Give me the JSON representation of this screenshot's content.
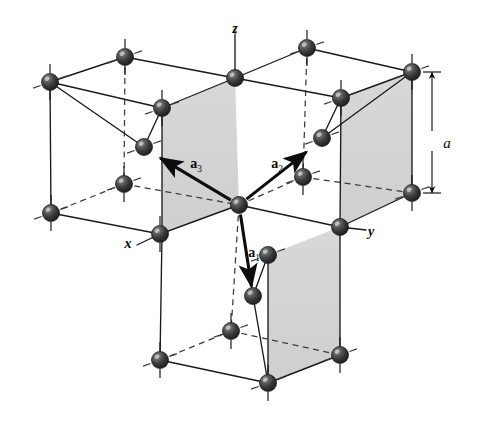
{
  "figure": {
    "background_color": "#ffffff",
    "width": 481,
    "height": 424
  },
  "colors": {
    "atom_dark": "#2b2b2b",
    "atom_mid": "#4a4a4a",
    "atom_highlight": "#c8c8c8",
    "line_solid": "#1a1a1a",
    "line_dashed": "#3a3a3a",
    "face_shade": "#d3d3d3",
    "label": "#0a0a0a"
  },
  "axes": [
    {
      "id": "x",
      "label": "x",
      "x": 128,
      "y": 245
    },
    {
      "id": "y",
      "label": "y",
      "x": 371,
      "y": 233
    },
    {
      "id": "z",
      "label": "z",
      "x": 235,
      "y": 30
    }
  ],
  "dimension": {
    "label": "a",
    "label_x": 447,
    "label_y": 145,
    "arrow_x": 432,
    "arrow_top_y": 72,
    "arrow_bottom_y": 193
  },
  "vectors": [
    {
      "id": "a1",
      "name": "a",
      "subscript": "1",
      "label_x": 254,
      "label_y": 257,
      "from_x": 239,
      "from_y": 205,
      "to_x": 253,
      "to_y": 296
    },
    {
      "id": "a2",
      "name": "a",
      "subscript": "2",
      "label_x": 277,
      "label_y": 168,
      "from_x": 239,
      "from_y": 205,
      "to_x": 314,
      "to_y": 146
    },
    {
      "id": "a3",
      "name": "a",
      "subscript": "3",
      "label_x": 196,
      "label_y": 168,
      "from_x": 239,
      "from_y": 205,
      "to_x": 152,
      "to_y": 153
    }
  ],
  "atoms": [
    {
      "id": "atom-01",
      "x": 50,
      "y": 82,
      "r": 8.5
    },
    {
      "id": "atom-02",
      "x": 125,
      "y": 57,
      "r": 8.5
    },
    {
      "id": "atom-03",
      "x": 235,
      "y": 78,
      "r": 8.5
    },
    {
      "id": "atom-04",
      "x": 307,
      "y": 48,
      "r": 8.5
    },
    {
      "id": "atom-05",
      "x": 412,
      "y": 72,
      "r": 8.5
    },
    {
      "id": "atom-06",
      "x": 162,
      "y": 108,
      "r": 8.5
    },
    {
      "id": "atom-07",
      "x": 341,
      "y": 98,
      "r": 8.5
    },
    {
      "id": "atom-08",
      "x": 144,
      "y": 147,
      "r": 8.5
    },
    {
      "id": "atom-09",
      "x": 322,
      "y": 138,
      "r": 8.5
    },
    {
      "id": "atom-10",
      "x": 124,
      "y": 184,
      "r": 8.5
    },
    {
      "id": "atom-11",
      "x": 303,
      "y": 177,
      "r": 8.5
    },
    {
      "id": "atom-12",
      "x": 51,
      "y": 213,
      "r": 8.5
    },
    {
      "id": "atom-13",
      "x": 239,
      "y": 205,
      "r": 8.5
    },
    {
      "id": "atom-14",
      "x": 412,
      "y": 193,
      "r": 8.5
    },
    {
      "id": "atom-15",
      "x": 160,
      "y": 234,
      "r": 8.5
    },
    {
      "id": "atom-16",
      "x": 340,
      "y": 227,
      "r": 8.5
    },
    {
      "id": "atom-17",
      "x": 268,
      "y": 255,
      "r": 8.5
    },
    {
      "id": "atom-18",
      "x": 253,
      "y": 296,
      "r": 8.5
    },
    {
      "id": "atom-19",
      "x": 231,
      "y": 331,
      "r": 8.5
    },
    {
      "id": "atom-20",
      "x": 160,
      "y": 360,
      "r": 8.5
    },
    {
      "id": "atom-21",
      "x": 340,
      "y": 355,
      "r": 8.5
    },
    {
      "id": "atom-22",
      "x": 268,
      "y": 383,
      "r": 8.5
    }
  ],
  "shaded_faces": [
    {
      "id": "face-upper-left",
      "points": "162,108 235,78 239,205 162,232"
    },
    {
      "id": "face-upper-right",
      "points": "340,227 412,193 412,72 340,98"
    },
    {
      "id": "face-lower-right",
      "points": "268,383 340,355 340,227 268,255"
    }
  ],
  "solid_edges": [
    {
      "id": "e-top-back-left",
      "x1": 50,
      "y1": 82,
      "x2": 125,
      "y2": 57
    },
    {
      "id": "e-top-left-mid",
      "x1": 125,
      "y1": 57,
      "x2": 235,
      "y2": 78
    },
    {
      "id": "e-top-mid-right",
      "x1": 235,
      "y1": 78,
      "x2": 307,
      "y2": 48
    },
    {
      "id": "e-top-right-end",
      "x1": 307,
      "y1": 48,
      "x2": 412,
      "y2": 72
    },
    {
      "id": "e-top-leftface",
      "x1": 50,
      "y1": 82,
      "x2": 162,
      "y2": 108
    },
    {
      "id": "e-top-leftface2",
      "x1": 162,
      "y1": 108,
      "x2": 235,
      "y2": 78
    },
    {
      "id": "e-top-rightface",
      "x1": 235,
      "y1": 78,
      "x2": 341,
      "y2": 98
    },
    {
      "id": "e-top-rightface2",
      "x1": 341,
      "y1": 98,
      "x2": 412,
      "y2": 72
    },
    {
      "id": "e-diag-left",
      "x1": 50,
      "y1": 82,
      "x2": 144,
      "y2": 147
    },
    {
      "id": "e-diag-left2",
      "x1": 144,
      "y1": 147,
      "x2": 162,
      "y2": 108
    },
    {
      "id": "e-diag-right",
      "x1": 412,
      "y1": 72,
      "x2": 322,
      "y2": 138
    },
    {
      "id": "e-diag-right2",
      "x1": 322,
      "y1": 138,
      "x2": 341,
      "y2": 98
    },
    {
      "id": "e-vert-left-top",
      "x1": 50,
      "y1": 82,
      "x2": 51,
      "y2": 213
    },
    {
      "id": "e-vert-mid-top",
      "x1": 162,
      "y1": 108,
      "x2": 162,
      "y2": 234
    },
    {
      "id": "e-vert-z",
      "x1": 235,
      "y1": 36,
      "x2": 235,
      "y2": 78
    },
    {
      "id": "e-vert-rmid-top",
      "x1": 341,
      "y1": 98,
      "x2": 340,
      "y2": 227
    },
    {
      "id": "e-vert-right-top",
      "x1": 412,
      "y1": 72,
      "x2": 412,
      "y2": 193
    },
    {
      "id": "e-mid-left-horiz",
      "x1": 51,
      "y1": 213,
      "x2": 160,
      "y2": 234
    },
    {
      "id": "e-mid-left-ctr",
      "x1": 160,
      "y1": 234,
      "x2": 239,
      "y2": 205
    },
    {
      "id": "e-mid-ctr-right",
      "x1": 239,
      "y1": 205,
      "x2": 340,
      "y2": 227
    },
    {
      "id": "e-mid-right-end",
      "x1": 340,
      "y1": 227,
      "x2": 412,
      "y2": 193
    },
    {
      "id": "e-vert-mid-lower",
      "x1": 162,
      "y1": 234,
      "x2": 160,
      "y2": 360
    },
    {
      "id": "e-vert-ctr-lower",
      "x1": 268,
      "y1": 255,
      "x2": 268,
      "y2": 383
    },
    {
      "id": "e-vert-rm-lower",
      "x1": 340,
      "y1": 227,
      "x2": 340,
      "y2": 355
    },
    {
      "id": "e-bot-left-ctr",
      "x1": 160,
      "y1": 360,
      "x2": 268,
      "y2": 383
    },
    {
      "id": "e-bot-ctr-right",
      "x1": 268,
      "y1": 383,
      "x2": 340,
      "y2": 355
    },
    {
      "id": "e-tet-lower",
      "x1": 253,
      "y1": 296,
      "x2": 268,
      "y2": 383
    },
    {
      "id": "e-tet-lower2",
      "x1": 253,
      "y1": 296,
      "x2": 268,
      "y2": 255
    },
    {
      "id": "e-yaxis",
      "x1": 340,
      "y1": 227,
      "x2": 366,
      "y2": 230
    },
    {
      "id": "e-xaxis",
      "x1": 160,
      "y1": 234,
      "x2": 137,
      "y2": 245
    }
  ],
  "dashed_edges": [
    {
      "id": "d-vert-back-left",
      "x1": 125,
      "y1": 57,
      "x2": 124,
      "y2": 184
    },
    {
      "id": "d-vert-back-right",
      "x1": 307,
      "y1": 48,
      "x2": 303,
      "y2": 177
    },
    {
      "id": "d-back-left-horiz",
      "x1": 51,
      "y1": 213,
      "x2": 124,
      "y2": 184
    },
    {
      "id": "d-back-left-ctr",
      "x1": 124,
      "y1": 184,
      "x2": 239,
      "y2": 205
    },
    {
      "id": "d-back-ctr-right",
      "x1": 239,
      "y1": 205,
      "x2": 303,
      "y2": 177
    },
    {
      "id": "d-back-right-end",
      "x1": 303,
      "y1": 177,
      "x2": 412,
      "y2": 193
    },
    {
      "id": "d-vert-z-upper",
      "x1": 235,
      "y1": 36,
      "x2": 235,
      "y2": 26
    },
    {
      "id": "d-vert-lower-ctr",
      "x1": 239,
      "y1": 205,
      "x2": 231,
      "y2": 331
    },
    {
      "id": "d-bot-back-left",
      "x1": 160,
      "y1": 360,
      "x2": 231,
      "y2": 331
    },
    {
      "id": "d-bot-back-right",
      "x1": 231,
      "y1": 331,
      "x2": 340,
      "y2": 355
    }
  ],
  "tick_marks": [
    {
      "id": "t-01",
      "x": 50,
      "y": 82,
      "angle": 20
    },
    {
      "id": "t-02",
      "x": 125,
      "y": 57,
      "angle": 20
    },
    {
      "id": "t-03",
      "x": 307,
      "y": 48,
      "angle": 20
    },
    {
      "id": "t-04",
      "x": 412,
      "y": 72,
      "angle": 20
    },
    {
      "id": "t-05",
      "x": 162,
      "y": 108,
      "angle": 20
    },
    {
      "id": "t-06",
      "x": 341,
      "y": 98,
      "angle": 20
    },
    {
      "id": "t-07",
      "x": 144,
      "y": 147,
      "angle": 20
    },
    {
      "id": "t-08",
      "x": 322,
      "y": 138,
      "angle": 20
    },
    {
      "id": "t-09",
      "x": 124,
      "y": 184,
      "angle": 20
    },
    {
      "id": "t-10",
      "x": 303,
      "y": 177,
      "angle": 20
    },
    {
      "id": "t-11",
      "x": 51,
      "y": 213,
      "angle": 20
    },
    {
      "id": "t-12",
      "x": 412,
      "y": 193,
      "angle": 20
    },
    {
      "id": "t-13",
      "x": 268,
      "y": 255,
      "angle": 20
    },
    {
      "id": "t-14",
      "x": 231,
      "y": 331,
      "angle": 20
    },
    {
      "id": "t-15",
      "x": 160,
      "y": 360,
      "angle": 20
    },
    {
      "id": "t-16",
      "x": 340,
      "y": 355,
      "angle": 20
    },
    {
      "id": "t-17",
      "x": 268,
      "y": 383,
      "angle": 20
    }
  ],
  "vertical_stubs": [
    {
      "id": "vs-01",
      "x": 50,
      "y": 82
    },
    {
      "id": "vs-02",
      "x": 125,
      "y": 57
    },
    {
      "id": "vs-03",
      "x": 307,
      "y": 48
    },
    {
      "id": "vs-04",
      "x": 412,
      "y": 72
    },
    {
      "id": "vs-05",
      "x": 162,
      "y": 108
    },
    {
      "id": "vs-06",
      "x": 341,
      "y": 98
    },
    {
      "id": "vs-07",
      "x": 124,
      "y": 184
    },
    {
      "id": "vs-08",
      "x": 303,
      "y": 177
    },
    {
      "id": "vs-09",
      "x": 51,
      "y": 213
    },
    {
      "id": "vs-10",
      "x": 412,
      "y": 193
    },
    {
      "id": "vs-11",
      "x": 231,
      "y": 331
    },
    {
      "id": "vs-12",
      "x": 160,
      "y": 360
    },
    {
      "id": "vs-13",
      "x": 340,
      "y": 355
    },
    {
      "id": "vs-14",
      "x": 268,
      "y": 383
    },
    {
      "id": "vs-15",
      "x": 160,
      "y": 234
    }
  ]
}
